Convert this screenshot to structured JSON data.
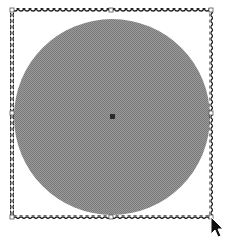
{
  "canvas": {
    "width": 227,
    "height": 239,
    "background": "#ffffff"
  },
  "shape": {
    "type": "circle",
    "cx": 112,
    "cy": 117,
    "r": 98,
    "fill": "#8c8c8c",
    "fill_pattern": "dithered-gray"
  },
  "center_marker": {
    "x": 110,
    "y": 114,
    "size": 5,
    "color": "#2a2a2a"
  },
  "selection_box": {
    "x": 12,
    "y": 10,
    "width": 199,
    "height": 207,
    "border_color": "#222222",
    "border_style": "chain-dashed",
    "handles": [
      {
        "name": "top-left",
        "x": 12,
        "y": 10
      },
      {
        "name": "top-middle",
        "x": 111,
        "y": 10
      },
      {
        "name": "top-right",
        "x": 211,
        "y": 10
      },
      {
        "name": "middle-left",
        "x": 12,
        "y": 113
      },
      {
        "name": "middle-right",
        "x": 211,
        "y": 113
      },
      {
        "name": "bottom-left",
        "x": 12,
        "y": 217
      },
      {
        "name": "bottom-middle",
        "x": 111,
        "y": 217
      },
      {
        "name": "bottom-right",
        "x": 211,
        "y": 217
      }
    ]
  },
  "cursor": {
    "type": "arrow-pointer",
    "x": 211,
    "y": 217,
    "color": "#111111"
  }
}
